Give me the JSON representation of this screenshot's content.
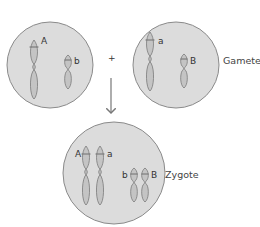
{
  "diagram": {
    "gametes_label": "Gametes",
    "zygote_label": "Zygote",
    "plus_sign": "+",
    "colors": {
      "cell_fill": "#dcdcdc",
      "cell_stroke": "#8a8a8a",
      "chromosome_fill": "#c4c4c4",
      "chromosome_stroke": "#7a7a7a",
      "arrow": "#777777"
    },
    "gamete_1": {
      "alleles": [
        "A",
        "b"
      ]
    },
    "gamete_2": {
      "alleles": [
        "a",
        "B"
      ]
    },
    "zygote": {
      "alleles_large": [
        "A",
        "a"
      ],
      "alleles_small": [
        "b",
        "B"
      ]
    }
  }
}
